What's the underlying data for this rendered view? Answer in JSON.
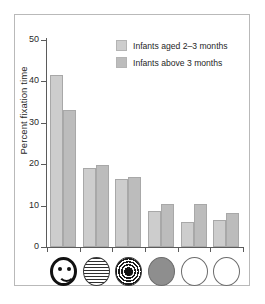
{
  "chart_data": {
    "type": "bar",
    "title": "",
    "xlabel": "",
    "ylabel": "Percent fixation time",
    "ylim": [
      0,
      50
    ],
    "yticks": [
      0,
      10,
      20,
      30,
      40,
      50
    ],
    "grid": false,
    "legend_position": "top-right",
    "categories": [
      "face pattern",
      "horizontal stripes pattern",
      "concentric bullseye pattern",
      "plain gray disc",
      "plain white disc",
      "plain white disc"
    ],
    "series": [
      {
        "name": "Infants aged 2–3 months",
        "values": [
          41.5,
          19.2,
          16.5,
          8.8,
          6.0,
          6.6
        ]
      },
      {
        "name": "Infants above 3 months",
        "values": [
          33.0,
          19.8,
          16.9,
          10.4,
          10.3,
          8.3
        ]
      }
    ]
  },
  "axes": {
    "ylabel": "Percent fixation time",
    "ytick_labels": [
      "50",
      "40",
      "30",
      "20",
      "10",
      "0"
    ]
  },
  "legend": {
    "entries": [
      {
        "label": "Infants aged 2–3 months",
        "color": "#cdcdcd"
      },
      {
        "label": "Infants above 3 months",
        "color": "#bcbcbc"
      }
    ]
  },
  "stimuli": [
    {
      "name": "face-icon",
      "kind": "face"
    },
    {
      "name": "stripes-icon",
      "kind": "stripes"
    },
    {
      "name": "bullseye-icon",
      "kind": "bullseye"
    },
    {
      "name": "gray-disc-icon",
      "kind": "gray"
    },
    {
      "name": "white-disc-icon",
      "kind": "white"
    },
    {
      "name": "white-disc-icon-2",
      "kind": "white"
    }
  ],
  "colors": {
    "series1": "#cdcdcd",
    "series2": "#bcbcbc",
    "axis": "#5b5b5b",
    "frame": "#b9b9b9",
    "text": "#1f1f1f",
    "background": "#ffffff"
  }
}
